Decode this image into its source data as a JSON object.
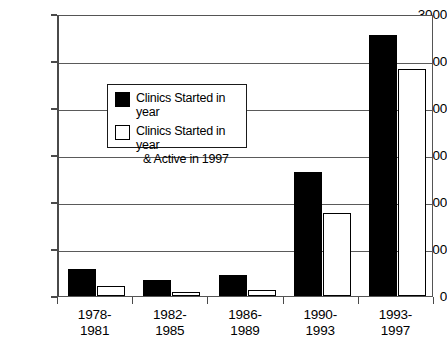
{
  "chart_data": {
    "type": "bar",
    "title": "",
    "xlabel": "",
    "ylabel": "",
    "ylim": [
      0,
      3000
    ],
    "ytick_interval": 500,
    "yticks": [
      "3000",
      "2500",
      "2000",
      "1500",
      "1000",
      "500",
      "0"
    ],
    "ytick_values": [
      3000,
      2500,
      2000,
      1500,
      1000,
      500,
      0
    ],
    "grid": true,
    "legend_position": "upper-left-inside",
    "categories": [
      "1978-1981",
      "1982-1985",
      "1986-1989",
      "1990-1993",
      "1993-1997"
    ],
    "category_lines": [
      [
        "1978-",
        "1981"
      ],
      [
        "1982-",
        "1985"
      ],
      [
        "1986-",
        "1989"
      ],
      [
        "1990-",
        "1993"
      ],
      [
        "1993-",
        "1997"
      ]
    ],
    "series": [
      {
        "name": "Clinics Started in year",
        "style": "filled-black",
        "color": "#000000",
        "values": [
          290,
          175,
          225,
          1320,
          2780
        ]
      },
      {
        "name": "Clinics Started in year & Active in 1997",
        "style": "hollow-white",
        "color": "#ffffff",
        "values": [
          105,
          45,
          65,
          880,
          2420
        ]
      }
    ]
  },
  "legend": {
    "items": [
      {
        "label": "Clinics Started in year",
        "label_line2": "",
        "swatch": "filled"
      },
      {
        "label": "Clinics Started in year",
        "label_line2": "& Active in 1997",
        "swatch": "hollow"
      }
    ]
  },
  "colors": {
    "series_started": "#000000",
    "series_active": "#ffffff",
    "axis": "#4a4a4a",
    "grid": "#5a5a5a",
    "background": "#ffffff",
    "text": "#000000"
  }
}
